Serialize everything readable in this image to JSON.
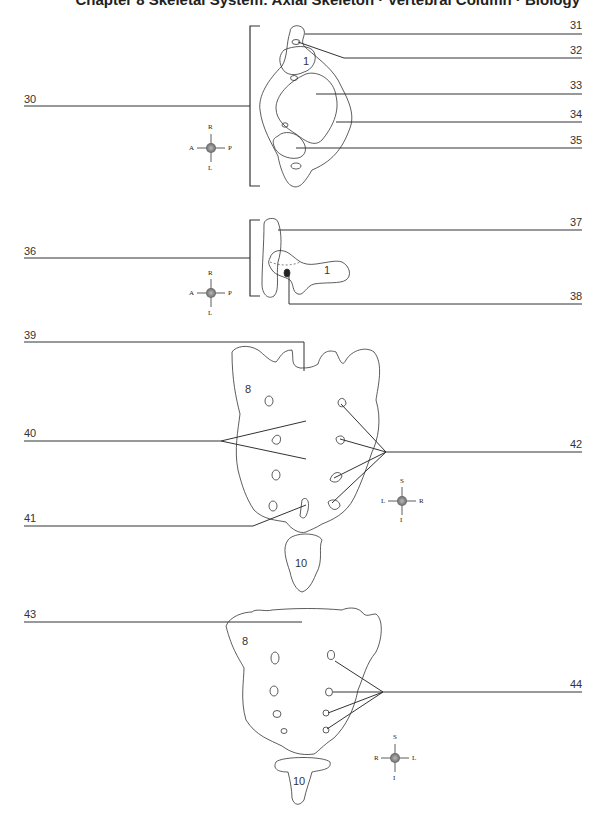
{
  "header": {
    "title": "Chapter 8 Skeletal System: Axial Skeleton · Vertebral Column · Biology"
  },
  "diagrams": [
    {
      "id": "vertebra-superior-view",
      "left_labels": [
        {
          "num": "30"
        }
      ],
      "right_labels": [
        {
          "num": "31"
        },
        {
          "num": "32"
        },
        {
          "num": "33"
        },
        {
          "num": "34"
        },
        {
          "num": "35"
        }
      ],
      "bone_numbers": [
        "1"
      ],
      "compass": {
        "top": "R",
        "bottom": "L",
        "left": "A",
        "right": "P"
      }
    },
    {
      "id": "vertebra-lateral-view",
      "left_labels": [
        {
          "num": "36"
        }
      ],
      "right_labels": [
        {
          "num": "37"
        },
        {
          "num": "38"
        }
      ],
      "bone_numbers": [
        "1"
      ],
      "compass": {
        "top": "R",
        "bottom": "L",
        "left": "A",
        "right": "P"
      }
    },
    {
      "id": "sacrum-anterior-view",
      "left_labels": [
        {
          "num": "39"
        },
        {
          "num": "40"
        },
        {
          "num": "41"
        }
      ],
      "right_labels": [
        {
          "num": "42"
        }
      ],
      "bone_numbers": [
        "8",
        "10"
      ],
      "compass": {
        "top": "S",
        "bottom": "I",
        "left": "L",
        "right": "R"
      }
    },
    {
      "id": "sacrum-posterior-view",
      "left_labels": [
        {
          "num": "43"
        }
      ],
      "right_labels": [
        {
          "num": "44"
        }
      ],
      "bone_numbers": [
        "8",
        "10"
      ],
      "compass": {
        "top": "S",
        "bottom": "I",
        "left": "R",
        "right": "L"
      }
    }
  ]
}
